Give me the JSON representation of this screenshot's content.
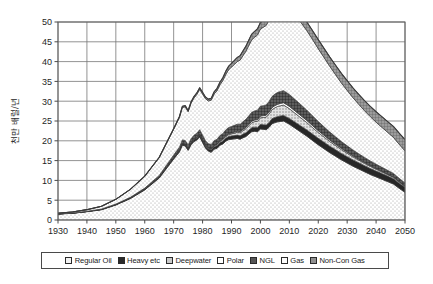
{
  "chart_data": {
    "type": "area",
    "title": "",
    "subtitle": "",
    "xlabel": "",
    "ylabel": "천만 배럴/년",
    "xlim": [
      1930,
      2050
    ],
    "ylim": [
      0,
      50
    ],
    "ytick_step": 5,
    "xtick_step": 10,
    "grid": true,
    "stacked": true,
    "legend_position": "bottom",
    "xticks": [
      "1930",
      "1940",
      "1950",
      "1960",
      "1970",
      "1980",
      "1990",
      "2000",
      "2010",
      "2020",
      "2030",
      "2040",
      "2050"
    ],
    "yticks": [
      "0",
      "5",
      "10",
      "15",
      "20",
      "25",
      "30",
      "35",
      "40",
      "45",
      "50"
    ],
    "x": [
      1930,
      1935,
      1940,
      1945,
      1950,
      1955,
      1960,
      1965,
      1970,
      1971,
      1972,
      1973,
      1974,
      1975,
      1976,
      1977,
      1978,
      1979,
      1980,
      1981,
      1982,
      1983,
      1984,
      1985,
      1986,
      1987,
      1988,
      1989,
      1990,
      1991,
      1992,
      1993,
      1994,
      1995,
      1996,
      1997,
      1998,
      1999,
      2000,
      2001,
      2002,
      2003,
      2004,
      2005,
      2006,
      2007,
      2008,
      2009,
      2010,
      2012,
      2014,
      2016,
      2018,
      2020,
      2022,
      2024,
      2026,
      2028,
      2030,
      2032,
      2034,
      2036,
      2038,
      2040,
      2042,
      2044,
      2046,
      2048,
      2050
    ],
    "series": [
      {
        "name": "Regular Oil",
        "color": "#efefef",
        "pattern": "dots-fine",
        "values": [
          1.5,
          1.7,
          2.1,
          2.6,
          3.8,
          5.4,
          7.6,
          10.6,
          15.4,
          16.3,
          17.2,
          18.9,
          18.7,
          17.6,
          19.0,
          19.8,
          20.2,
          21.0,
          19.6,
          18.2,
          17.4,
          17.1,
          17.9,
          18.1,
          18.9,
          19.2,
          19.9,
          20.3,
          20.4,
          20.5,
          20.6,
          20.4,
          20.8,
          21.1,
          21.7,
          22.3,
          22.4,
          22.3,
          23.0,
          22.9,
          22.8,
          23.4,
          24.3,
          24.6,
          24.8,
          24.9,
          25.0,
          24.6,
          24.2,
          23.2,
          22.2,
          21.2,
          20.1,
          19.0,
          18.0,
          17.0,
          16.1,
          15.2,
          14.4,
          13.6,
          12.9,
          12.2,
          11.5,
          10.9,
          10.3,
          9.7,
          9.1,
          8.0,
          7.0
        ]
      },
      {
        "name": "Heavy etc",
        "color": "#232323",
        "pattern": "solid-dark",
        "values": [
          0.05,
          0.05,
          0.06,
          0.07,
          0.1,
          0.12,
          0.15,
          0.2,
          0.3,
          0.33,
          0.36,
          0.4,
          0.4,
          0.38,
          0.42,
          0.45,
          0.47,
          0.5,
          0.5,
          0.5,
          0.52,
          0.55,
          0.6,
          0.62,
          0.66,
          0.7,
          0.74,
          0.78,
          0.8,
          0.82,
          0.84,
          0.86,
          0.9,
          0.94,
          0.98,
          1.02,
          1.05,
          1.08,
          1.12,
          1.15,
          1.18,
          1.22,
          1.26,
          1.3,
          1.34,
          1.38,
          1.42,
          1.44,
          1.46,
          1.5,
          1.54,
          1.58,
          1.6,
          1.62,
          1.64,
          1.64,
          1.64,
          1.62,
          1.6,
          1.58,
          1.55,
          1.52,
          1.5,
          1.46,
          1.42,
          1.38,
          1.34,
          1.3,
          1.25
        ]
      },
      {
        "name": "Deepwater",
        "color": "#c4c4c4",
        "pattern": "dots-coarse",
        "values": [
          0,
          0,
          0,
          0,
          0,
          0,
          0,
          0,
          0.02,
          0.03,
          0.04,
          0.05,
          0.06,
          0.07,
          0.08,
          0.1,
          0.12,
          0.14,
          0.16,
          0.18,
          0.2,
          0.22,
          0.26,
          0.3,
          0.34,
          0.38,
          0.44,
          0.5,
          0.56,
          0.62,
          0.7,
          0.78,
          0.88,
          1.0,
          1.12,
          1.26,
          1.4,
          1.55,
          1.7,
          1.85,
          2.0,
          2.15,
          2.3,
          2.45,
          2.55,
          2.6,
          2.6,
          2.55,
          2.45,
          2.25,
          2.05,
          1.85,
          1.65,
          1.48,
          1.32,
          1.18,
          1.05,
          0.95,
          0.85,
          0.76,
          0.68,
          0.6,
          0.54,
          0.48,
          0.43,
          0.38,
          0.34,
          0.3,
          0.26
        ]
      },
      {
        "name": "Polar",
        "color": "#ffffff",
        "pattern": "blank",
        "values": [
          0,
          0,
          0,
          0,
          0,
          0,
          0,
          0,
          0,
          0,
          0,
          0,
          0.02,
          0.03,
          0.04,
          0.05,
          0.06,
          0.07,
          0.08,
          0.09,
          0.1,
          0.11,
          0.12,
          0.14,
          0.16,
          0.18,
          0.2,
          0.22,
          0.24,
          0.26,
          0.28,
          0.3,
          0.32,
          0.34,
          0.36,
          0.38,
          0.4,
          0.42,
          0.44,
          0.46,
          0.48,
          0.5,
          0.52,
          0.54,
          0.56,
          0.58,
          0.6,
          0.6,
          0.6,
          0.58,
          0.56,
          0.54,
          0.5,
          0.46,
          0.42,
          0.38,
          0.35,
          0.32,
          0.29,
          0.26,
          0.23,
          0.21,
          0.19,
          0.17,
          0.15,
          0.14,
          0.12,
          0.11,
          0.1
        ]
      },
      {
        "name": "NGL",
        "color": "#4f4f4f",
        "pattern": "grid-dark",
        "values": [
          0.02,
          0.03,
          0.05,
          0.08,
          0.12,
          0.2,
          0.3,
          0.45,
          0.7,
          0.75,
          0.8,
          0.88,
          0.9,
          0.88,
          0.95,
          1.0,
          1.05,
          1.1,
          1.08,
          1.05,
          1.05,
          1.08,
          1.15,
          1.2,
          1.28,
          1.35,
          1.45,
          1.55,
          1.62,
          1.7,
          1.78,
          1.85,
          1.95,
          2.05,
          2.15,
          2.25,
          2.3,
          2.38,
          2.48,
          2.52,
          2.58,
          2.68,
          2.8,
          2.9,
          2.98,
          3.02,
          3.05,
          3.02,
          2.98,
          2.88,
          2.76,
          2.62,
          2.48,
          2.32,
          2.16,
          2.0,
          1.86,
          1.72,
          1.6,
          1.48,
          1.37,
          1.27,
          1.18,
          1.09,
          1.01,
          0.94,
          0.87,
          0.81,
          0.75
        ]
      },
      {
        "name": "Gas",
        "color": "#f7f7f7",
        "pattern": "dots-fine",
        "values": [
          0.15,
          0.25,
          0.4,
          0.7,
          1.2,
          2.0,
          3.0,
          4.5,
          6.5,
          7.0,
          7.5,
          8.2,
          8.5,
          8.4,
          9.0,
          9.4,
          9.8,
          10.2,
          10.4,
          10.6,
          10.8,
          11.2,
          11.8,
          12.3,
          12.8,
          13.4,
          14.0,
          14.6,
          15.0,
          15.4,
          15.8,
          16.2,
          16.7,
          17.2,
          17.8,
          18.3,
          18.6,
          19.0,
          19.5,
          19.8,
          20.1,
          20.6,
          21.2,
          21.6,
          21.9,
          22.1,
          22.2,
          22.1,
          21.9,
          21.4,
          20.8,
          20.1,
          19.3,
          18.4,
          17.5,
          16.6,
          15.7,
          14.8,
          14.0,
          13.2,
          12.5,
          11.8,
          11.2,
          10.6,
          10.1,
          9.6,
          9.1,
          8.6,
          8.1
        ]
      },
      {
        "name": "Non-Con Gas",
        "color": "#8a8a8a",
        "pattern": "grid-mid",
        "values": [
          0,
          0,
          0,
          0,
          0,
          0.02,
          0.05,
          0.1,
          0.2,
          0.22,
          0.25,
          0.28,
          0.3,
          0.3,
          0.33,
          0.36,
          0.38,
          0.4,
          0.42,
          0.44,
          0.46,
          0.5,
          0.55,
          0.6,
          0.66,
          0.72,
          0.8,
          0.88,
          0.95,
          1.0,
          1.06,
          1.12,
          1.2,
          1.28,
          1.36,
          1.44,
          1.5,
          1.56,
          1.62,
          1.68,
          1.74,
          1.8,
          1.86,
          1.92,
          1.96,
          2.0,
          2.02,
          2.04,
          2.06,
          2.1,
          2.14,
          2.18,
          2.22,
          2.26,
          2.3,
          2.34,
          2.38,
          2.42,
          2.45,
          2.48,
          2.52,
          2.56,
          2.6,
          2.64,
          2.68,
          2.72,
          2.76,
          2.8,
          2.84
        ]
      }
    ],
    "annotations": {
      "peak_year": "2008",
      "peak_total": "48",
      "start_total": "1.7",
      "end_total": "24.5"
    }
  },
  "legend": {
    "items": [
      {
        "label": "Regular Oil",
        "swatch": "sw-regular"
      },
      {
        "label": "Heavy etc",
        "swatch": "sw-heavy"
      },
      {
        "label": "Deepwater",
        "swatch": "sw-deep"
      },
      {
        "label": "Polar",
        "swatch": "sw-polar"
      },
      {
        "label": "NGL",
        "swatch": "sw-ngl"
      },
      {
        "label": "Gas",
        "swatch": "sw-gas"
      },
      {
        "label": "Non-Con Gas",
        "swatch": "sw-noncon"
      }
    ]
  }
}
